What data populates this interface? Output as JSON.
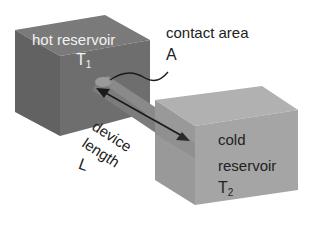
{
  "diagram": {
    "hot_reservoir": {
      "label": "hot reservoir",
      "temp_symbol": "T",
      "temp_subscript": "1",
      "colors": {
        "front": "#6b6b6b",
        "side": "#5a5a5a",
        "top": "#7a7a7a"
      }
    },
    "cold_reservoir": {
      "label_line1": "cold",
      "label_line2": "reservoir",
      "temp_symbol": "T",
      "temp_subscript": "2",
      "colors": {
        "front": "#a3a3a3",
        "side": "#959595",
        "top": "#b3b3b3"
      }
    },
    "device": {
      "label_line1": "device",
      "label_line2": "length",
      "symbol": "L",
      "color": "#8f8f8f"
    },
    "contact_area": {
      "label": "contact area",
      "symbol": "A"
    }
  }
}
